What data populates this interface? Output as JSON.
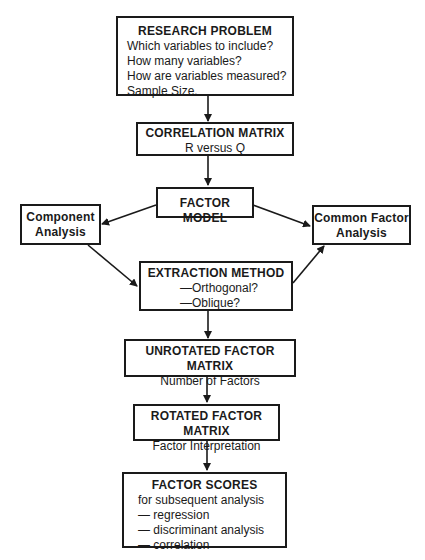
{
  "diagram": {
    "nodes": {
      "research_problem": {
        "title": "RESEARCH PROBLEM",
        "lines": [
          "Which variables to include?",
          "How many variables?",
          "How are variables measured?",
          "Sample Size."
        ]
      },
      "correlation_matrix": {
        "title": "CORRELATION MATRIX",
        "lines": [
          "R versus Q"
        ]
      },
      "factor_model": {
        "title": "FACTOR MODEL"
      },
      "component_analysis": {
        "title_line1": "Component",
        "title_line2": "Analysis"
      },
      "common_factor_analysis": {
        "title_line1": "Common Factor",
        "title_line2": "Analysis"
      },
      "extraction_method": {
        "title": "EXTRACTION METHOD",
        "lines": [
          "—Orthogonal?",
          "—Oblique?"
        ]
      },
      "unrotated_factor_matrix": {
        "title": "UNROTATED FACTOR MATRIX",
        "lines": [
          "Number of Factors"
        ]
      },
      "rotated_factor_matrix": {
        "title": "ROTATED FACTOR MATRIX",
        "lines": [
          "Factor Interpretation"
        ]
      },
      "factor_scores": {
        "title": "FACTOR SCORES",
        "lines": [
          "for subsequent analysis",
          "— regression",
          "— discriminant analysis",
          "— correlation"
        ]
      }
    },
    "edges": [
      {
        "from": "research_problem",
        "to": "correlation_matrix"
      },
      {
        "from": "correlation_matrix",
        "to": "factor_model"
      },
      {
        "from": "factor_model",
        "to": "component_analysis"
      },
      {
        "from": "factor_model",
        "to": "common_factor_analysis"
      },
      {
        "from": "component_analysis",
        "to": "extraction_method"
      },
      {
        "from": "extraction_method",
        "to": "common_factor_analysis"
      },
      {
        "from": "extraction_method",
        "to": "unrotated_factor_matrix"
      },
      {
        "from": "unrotated_factor_matrix",
        "to": "rotated_factor_matrix"
      },
      {
        "from": "rotated_factor_matrix",
        "to": "factor_scores"
      }
    ],
    "colors": {
      "stroke": "#1a1a1a",
      "background": "#ffffff"
    }
  }
}
